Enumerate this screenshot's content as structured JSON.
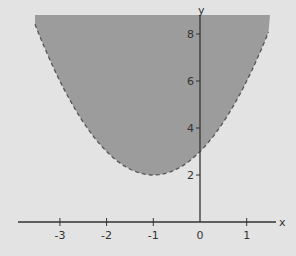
{
  "chart_data": {
    "type": "area",
    "title": "",
    "xlabel": "x",
    "ylabel": "y",
    "xlim": [
      -3.6,
      1.6
    ],
    "ylim": [
      0,
      8.8
    ],
    "x_ticks": [
      -3,
      -2,
      -1,
      0,
      1
    ],
    "y_ticks": [
      2,
      4,
      6,
      8
    ],
    "grid": false,
    "legend": null,
    "series": [
      {
        "name": "y > (x+1)^2 + 2",
        "boundary_style": "dashed",
        "shaded_region": "above curve",
        "x": [
          -3.5,
          -3,
          -2.5,
          -2,
          -1.5,
          -1,
          -0.5,
          0,
          0.5,
          1,
          1.5
        ],
        "values": [
          8.25,
          6,
          4.25,
          3,
          2.25,
          2,
          2.25,
          3,
          4.25,
          6,
          8.25
        ]
      }
    ],
    "colors": {
      "shade": "#9c9c9c",
      "background": "#e3e3e3",
      "axis": "#333333",
      "boundary": "#555555"
    }
  }
}
